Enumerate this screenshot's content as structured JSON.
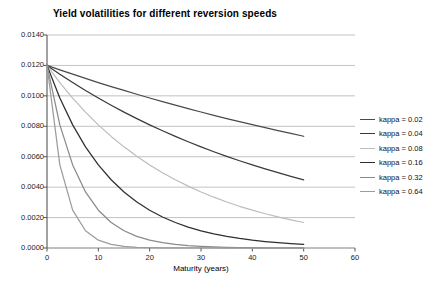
{
  "chart_data": {
    "type": "line",
    "title": "Yield volatilities for different reversion speeds",
    "xlabel": "Maturity (years)",
    "ylabel": "",
    "xlim": [
      0,
      60
    ],
    "ylim": [
      0.0,
      0.014
    ],
    "grid": true,
    "legend_position": "right",
    "xticks": [
      "0",
      "10",
      "20",
      "30",
      "40",
      "50",
      "60"
    ],
    "xtick_values": [
      0,
      10,
      20,
      30,
      40,
      50,
      60
    ],
    "yticks": [
      "0.0000",
      "0.0020",
      "0.0040",
      "0.0060",
      "0.0080",
      "0.0100",
      "0.0120",
      "0.0140"
    ],
    "ytick_values": [
      0.0,
      0.002,
      0.004,
      0.006,
      0.008,
      0.01,
      0.012,
      0.014
    ],
    "x": [
      0,
      2.5,
      5,
      7.5,
      10,
      12.5,
      15,
      17.5,
      20,
      22.5,
      25,
      27.5,
      30,
      32.5,
      35,
      37.5,
      40,
      42.5,
      45,
      47.5,
      50
    ],
    "series": [
      {
        "name": "kappa = 0.02",
        "kappa": 0.02,
        "color": "#4a4a4a",
        "values": [
          0.012,
          0.011708,
          0.011424,
          0.011147,
          0.010876,
          0.010612,
          0.010355,
          0.010104,
          0.009859,
          0.00962,
          0.009387,
          0.00916,
          0.008938,
          0.008721,
          0.00851,
          0.008304,
          0.008102,
          0.007906,
          0.007714,
          0.007527,
          0.007345
        ]
      },
      {
        "name": "kappa = 0.04",
        "kappa": 0.04,
        "color": "#3a3a3a",
        "values": [
          0.012,
          0.011423,
          0.010875,
          0.010352,
          0.009855,
          0.009382,
          0.008931,
          0.008502,
          0.008094,
          0.007705,
          0.007335,
          0.006983,
          0.006648,
          0.006329,
          0.006025,
          0.005736,
          0.005461,
          0.005198,
          0.004948,
          0.00471,
          0.004484
        ]
      },
      {
        "name": "kappa = 0.08",
        "kappa": 0.08,
        "color": "#bdbdbd",
        "values": [
          0.012,
          0.010875,
          0.009855,
          0.008931,
          0.008094,
          0.007335,
          0.006648,
          0.006025,
          0.00546,
          0.004948,
          0.004484,
          0.004064,
          0.003683,
          0.003338,
          0.003025,
          0.002742,
          0.002485,
          0.002252,
          0.002041,
          0.00185,
          0.001677
        ]
      },
      {
        "name": "kappa = 0.16",
        "kappa": 0.16,
        "color": "#2e2e2e",
        "values": [
          0.012,
          0.009855,
          0.008094,
          0.006648,
          0.00546,
          0.004484,
          0.003683,
          0.003025,
          0.002485,
          0.002041,
          0.001677,
          0.001377,
          0.001131,
          0.000929,
          0.000763,
          0.000627,
          0.000515,
          0.000423,
          0.000347,
          0.000285,
          0.000234
        ]
      },
      {
        "name": "kappa = 0.32",
        "kappa": 0.32,
        "color": "#8a8a8a",
        "values": [
          0.012,
          0.008094,
          0.00546,
          0.003683,
          0.002485,
          0.001677,
          0.001131,
          0.000763,
          0.000515,
          0.000347,
          0.000234,
          0.000158,
          0.000107,
          7.2e-05,
          4.8e-05,
          3.3e-05,
          2.2e-05,
          1.5e-05,
          1e-05,
          7e-06,
          4e-06
        ]
      },
      {
        "name": "kappa = 0.64",
        "kappa": 0.64,
        "color": "#9c9c9c",
        "values": [
          0.012,
          0.00546,
          0.002485,
          0.001131,
          0.000515,
          0.000234,
          0.000107,
          4.8e-05,
          2.2e-05,
          1e-05,
          5e-06,
          2e-06,
          1e-06,
          4e-07,
          2e-07,
          1e-07,
          4e-08,
          2e-08,
          1e-08,
          4e-09,
          2e-09
        ]
      }
    ],
    "note": "All curves start at 0.0120 at maturity 0 and decay exponentially; higher kappa decays faster."
  },
  "axis_style": {
    "grid_color": "#b3b3b3",
    "axis_color": "#808080",
    "text_color": "#1a1a1a"
  }
}
